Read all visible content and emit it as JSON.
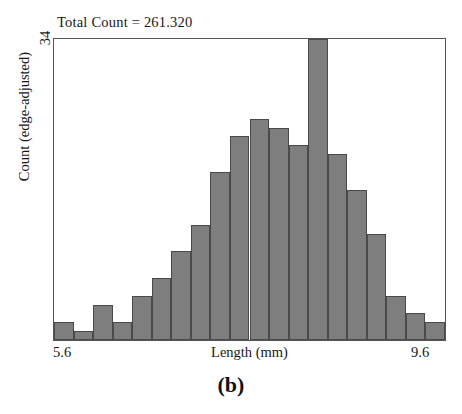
{
  "chart_data": {
    "type": "bar",
    "title": "Total Count = 261.320",
    "subtitle": "",
    "xlabel": "Length (mm)",
    "ylabel": "Count (edge-adjusted)",
    "xlim": [
      5.6,
      9.6
    ],
    "ylim": [
      0,
      34
    ],
    "x_tick_labels": [
      "5.6",
      "9.6"
    ],
    "y_tick_labels": [
      "34"
    ],
    "grid": false,
    "legend": null,
    "bar_color": "#7e7e7e",
    "bar_edge_color": "#4a4a4a",
    "bin_width": 0.2,
    "categories": [
      "5.6-5.8",
      "5.8-6.0",
      "6.0-6.2",
      "6.2-6.4",
      "6.4-6.6",
      "6.6-6.8",
      "6.8-7.0",
      "7.0-7.2",
      "7.2-7.4",
      "7.4-7.6",
      "7.6-7.8",
      "7.8-8.0",
      "8.0-8.2",
      "8.2-8.4",
      "8.4-8.6",
      "8.6-8.8",
      "8.8-9.0",
      "9.0-9.2",
      "9.2-9.4",
      "9.4-9.6"
    ],
    "bin_starts": [
      5.6,
      5.8,
      6.0,
      6.2,
      6.4,
      6.6,
      6.8,
      7.0,
      7.2,
      7.4,
      7.6,
      7.8,
      8.0,
      8.2,
      8.4,
      8.6,
      8.8,
      9.0,
      9.2,
      9.4
    ],
    "values": [
      2,
      1,
      4,
      2,
      5,
      7,
      10,
      13,
      19,
      23,
      25,
      24,
      22,
      34,
      21,
      17,
      12,
      5,
      3,
      2
    ],
    "annotations": [
      "Total Count = 261.320"
    ]
  },
  "figure": {
    "panel_caption": "(b)"
  }
}
